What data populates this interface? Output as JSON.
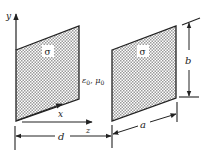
{
  "figure": {
    "colors": {
      "line": "#222222",
      "plate_fill": "#bdbdbd",
      "background": "#ffffff"
    }
  },
  "axes": {
    "y_label": "y",
    "x_label": "x",
    "z_label": "z"
  },
  "plates": [
    {
      "name": "left-plate",
      "label": "σ"
    },
    {
      "name": "right-plate",
      "label": "σ"
    }
  ],
  "medium_label": "ε0, μ0",
  "medium": {
    "eps": "ε",
    "eps_sub": "0",
    "sep": ", ",
    "mu": "μ",
    "mu_sub": "0"
  },
  "dimensions": {
    "separation": "d",
    "width": "a",
    "height": "b"
  }
}
